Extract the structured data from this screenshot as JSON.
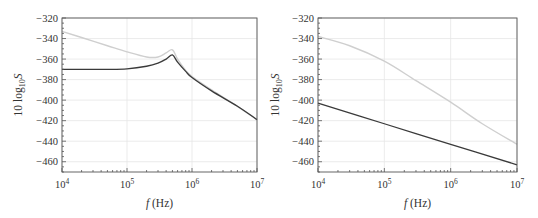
{
  "chart_data": [
    {
      "type": "line",
      "panel": "left",
      "title": "",
      "xlabel": "f (Hz)",
      "ylabel": "10 log10 S",
      "xscale": "log",
      "xlim": [
        10000,
        10000000
      ],
      "ylim": [
        -470,
        -320
      ],
      "xticks": [
        "10^4",
        "10^5",
        "10^6",
        "10^7"
      ],
      "yticks": [
        -320,
        -340,
        -360,
        -380,
        -400,
        -420,
        -440,
        -460
      ],
      "grid": true,
      "legend": null,
      "series": [
        {
          "name": "light curve",
          "color": "#cfcfcf",
          "x": [
            10000,
            20000,
            50000,
            100000,
            200000,
            300000,
            400000,
            500000,
            600000,
            800000,
            1000000,
            2000000,
            5000000,
            10000000
          ],
          "y": [
            -333,
            -339,
            -347,
            -353,
            -358,
            -358,
            -354,
            -351,
            -360,
            -371,
            -377,
            -390,
            -406,
            -419
          ]
        },
        {
          "name": "dark curve",
          "color": "#3a3a3a",
          "x": [
            10000,
            20000,
            50000,
            100000,
            200000,
            300000,
            400000,
            500000,
            600000,
            800000,
            1000000,
            2000000,
            5000000,
            10000000
          ],
          "y": [
            -370,
            -370,
            -370,
            -369.5,
            -367,
            -364,
            -360,
            -356,
            -363,
            -372,
            -378,
            -391,
            -406,
            -419
          ]
        }
      ]
    },
    {
      "type": "line",
      "panel": "right",
      "title": "",
      "xlabel": "f (Hz)",
      "ylabel": "10 log10 S",
      "xscale": "log",
      "xlim": [
        10000,
        10000000
      ],
      "ylim": [
        -470,
        -320
      ],
      "xticks": [
        "10^4",
        "10^5",
        "10^6",
        "10^7"
      ],
      "yticks": [
        -320,
        -340,
        -360,
        -380,
        -400,
        -420,
        -440,
        -460
      ],
      "grid": true,
      "legend": null,
      "series": [
        {
          "name": "light curve",
          "color": "#cfcfcf",
          "x": [
            10000,
            30000,
            100000,
            300000,
            1000000,
            3000000,
            10000000
          ],
          "y": [
            -338,
            -347,
            -362,
            -381,
            -402,
            -423,
            -443
          ]
        },
        {
          "name": "dark curve",
          "color": "#3a3a3a",
          "x": [
            10000,
            100000,
            1000000,
            10000000
          ],
          "y": [
            -403,
            -423,
            -443,
            -463
          ]
        }
      ]
    }
  ],
  "labels": {
    "xlabel_italic": "f",
    "xlabel_unit": " (Hz)",
    "ylabel_prefix": "10 log",
    "ylabel_sub": "10",
    "ylabel_var": "S",
    "xtick_base": "10",
    "xtick_exps": [
      "4",
      "5",
      "6",
      "7"
    ]
  }
}
